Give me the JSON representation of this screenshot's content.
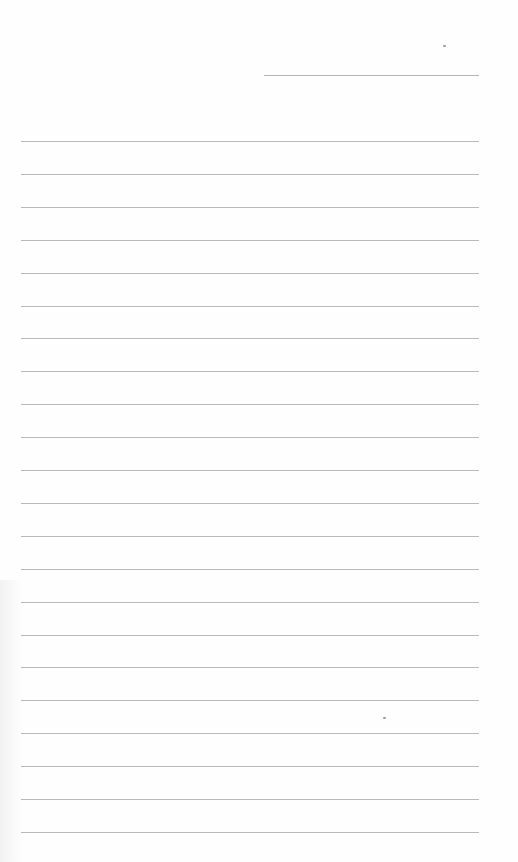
{
  "page": {
    "type": "blank-lined-sheet",
    "background_color": "#fefefe",
    "rule_color": "#b9b9b9",
    "date_line": {
      "left": 264,
      "top": 75,
      "width": 215
    },
    "rules": {
      "count": 22,
      "first_top": 141,
      "spacing": 32.9,
      "left": 21,
      "width": 458
    },
    "marks": [
      {
        "left": 443,
        "top": 45
      },
      {
        "left": 383,
        "top": 717
      }
    ]
  }
}
